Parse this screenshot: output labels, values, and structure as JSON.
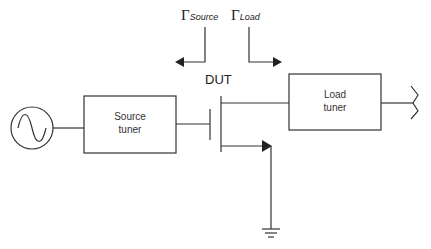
{
  "diagram": {
    "type": "load-pull measurement setup",
    "labels": {
      "gamma_symbol": "Γ",
      "gamma_source_sub": "Source",
      "gamma_load_sub": "Load",
      "dut": "DUT",
      "source_tuner_line1": "Source",
      "source_tuner_line2": "tuner",
      "load_tuner_line1": "Load",
      "load_tuner_line2": "tuner"
    },
    "components": [
      {
        "id": "signal-source",
        "kind": "ac-source"
      },
      {
        "id": "source-tuner",
        "kind": "box"
      },
      {
        "id": "dut",
        "kind": "transistor"
      },
      {
        "id": "load-tuner",
        "kind": "box"
      },
      {
        "id": "output-termination",
        "kind": "antenna-like"
      },
      {
        "id": "ground",
        "kind": "ground"
      }
    ],
    "colors": {
      "line": "#333333",
      "background": "#ffffff"
    }
  }
}
